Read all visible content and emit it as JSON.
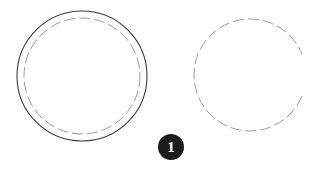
{
  "figure": {
    "background_color": "#ffffff",
    "width": 317,
    "height": 171,
    "shapes": [
      {
        "name": "left-outer-solid-circle",
        "role": "outer-contour",
        "style": "solid",
        "cx": 82,
        "cy": 76,
        "r": 65,
        "stroke_color": "#3a3a3a",
        "stroke_width": 1.1,
        "dash_array": "",
        "gap_start_deg": null,
        "gap_end_deg": null
      },
      {
        "name": "left-inner-dashed-circle",
        "role": "hidden-edge",
        "style": "dashed",
        "cx": 82,
        "cy": 76,
        "r": 58,
        "stroke_color": "#9a9a9a",
        "stroke_width": 1.0,
        "dash_array": "11 4",
        "gap_start_deg": null,
        "gap_end_deg": null
      },
      {
        "name": "right-dashed-circle",
        "role": "hidden-edge",
        "style": "dashed",
        "cx": 250,
        "cy": 75,
        "r": 56,
        "stroke_color": "#9a9a9a",
        "stroke_width": 1.0,
        "dash_array": "11 4",
        "gap_start_deg": -22,
        "gap_end_deg": 22
      }
    ]
  },
  "badge": {
    "name": "step-number-badge",
    "label": "1",
    "fill_color": "#1c1c1c",
    "text_color": "#ffffff",
    "cx": 171,
    "cy": 147,
    "r": 13
  }
}
